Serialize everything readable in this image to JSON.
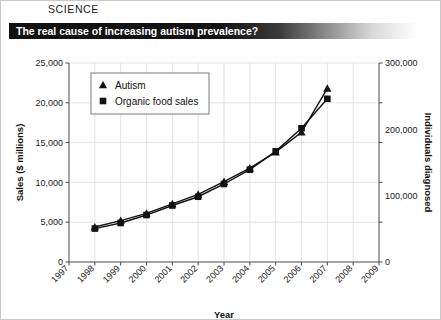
{
  "page": {
    "section_label": "SCIENCE",
    "headline": "The real cause of increasing autism prevalence?"
  },
  "colors": {
    "ink": "#121212",
    "grid": "#dcdcdc",
    "axis": "#4a4a4a",
    "title_bar_start": "#111111",
    "title_bar_end": "#ffffff"
  },
  "chart_data": {
    "type": "line",
    "title": "The real cause of increasing autism prevalence?",
    "xlabel": "Year",
    "ylabel": "Sales ($ millions)",
    "y2label": "Individuals diagnosed",
    "grid": true,
    "legend_position": "top-left-inside",
    "xlim": [
      1997,
      2009
    ],
    "ylim": [
      0,
      25000
    ],
    "y2lim": [
      0,
      300000
    ],
    "xticks": [
      "1997",
      "1998",
      "1999",
      "2000",
      "2001",
      "2002",
      "2003",
      "2004",
      "2005",
      "2006",
      "2007",
      "2008",
      "2009"
    ],
    "yticks": [
      "0",
      "5,000",
      "10,000",
      "15,000",
      "20,000",
      "25,000"
    ],
    "ytick_values": [
      0,
      5000,
      10000,
      15000,
      20000,
      25000
    ],
    "y2ticks": [
      "0",
      "100,000",
      "200,000",
      "300,000"
    ],
    "y2tick_values": [
      0,
      100000,
      200000,
      300000
    ],
    "x": [
      1998,
      1999,
      2000,
      2001,
      2002,
      2003,
      2004,
      2005,
      2006,
      2007
    ],
    "series": [
      {
        "name": "Autism",
        "marker": "triangle",
        "axis": "right",
        "values": [
          52000,
          62000,
          73000,
          87000,
          102000,
          121000,
          141000,
          166000,
          196000,
          219000
        ],
        "plot_values": [
          4400,
          5200,
          6100,
          7300,
          8500,
          10100,
          11800,
          13800,
          16300,
          21800
        ]
      },
      {
        "name": "Organic food sales",
        "marker": "square",
        "axis": "left",
        "values": [
          4200,
          4900,
          5900,
          7100,
          8200,
          9800,
          11600,
          13900,
          16800,
          20500
        ],
        "plot_values": [
          4200,
          4900,
          5900,
          7100,
          8200,
          9800,
          11600,
          13900,
          16800,
          20500
        ]
      }
    ]
  }
}
